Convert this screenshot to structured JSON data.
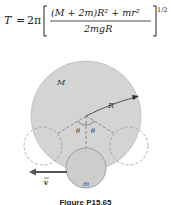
{
  "formula": {
    "lhs": "T",
    "equals": "=",
    "coef": "2π",
    "numerator": "(M + 2m)R² + mr²",
    "denominator": "2mgR",
    "exponent": "1/2"
  },
  "figure": {
    "labels": {
      "big_mass": "M",
      "radius": "R",
      "theta_left": "θ",
      "theta_right": "θ",
      "small_mass": "m",
      "velocity": "v"
    },
    "colors": {
      "disk_fill": "#d4d4d4",
      "small_disk_fill": "#cdcdcd",
      "stroke": "#888888",
      "dashed": "#9a9a9a",
      "arrow": "#555555"
    },
    "caption": "Figure P15.65"
  }
}
